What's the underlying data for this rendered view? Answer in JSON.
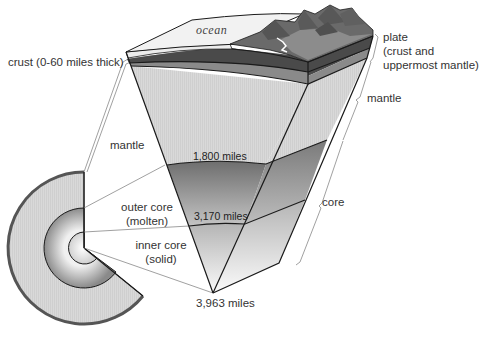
{
  "diagram": {
    "type": "earth-interior-cross-section",
    "labels": {
      "ocean": "ocean",
      "crust": "crust (0-60 miles thick)",
      "plate_line1": "plate",
      "plate_line2": "(crust and",
      "plate_line3": "uppermost mantle)",
      "mantle_right": "mantle",
      "mantle_left": "mantle",
      "depth_1800": "1,800 miles",
      "outer_core_line1": "outer core",
      "outer_core_line2": "(molten)",
      "depth_3170": "3,170 miles",
      "core_right": "core",
      "inner_core_line1": "inner core",
      "inner_core_line2": "(solid)",
      "depth_3963": "3,963 miles"
    },
    "layers": [
      {
        "name": "crust",
        "thickness": "0-60 miles"
      },
      {
        "name": "mantle",
        "depth_to": "1,800 miles"
      },
      {
        "name": "outer core",
        "state": "molten",
        "depth_to": "3,170 miles"
      },
      {
        "name": "inner core",
        "state": "solid",
        "depth_to": "3,963 miles"
      }
    ],
    "colors": {
      "ocean_surface": "#f2f2f2",
      "crust_dark": "#4a4a4a",
      "crust_mid": "#7a7a7a",
      "mantle": "#d6d6d6",
      "outer_core_top": "#7d7d7d",
      "outer_core_bottom": "#c8c8c8",
      "inner_core_top": "#b8b8b8",
      "inner_core_bottom": "#f5f5f5",
      "outline": "#1a1a1a"
    }
  }
}
